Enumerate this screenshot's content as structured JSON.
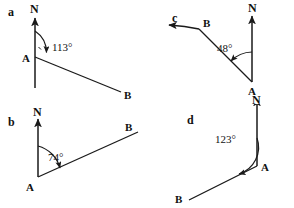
{
  "figure": {
    "type": "bearing-diagrams",
    "panel_count": 4,
    "stroke_color": "#1a1a1a",
    "background_color": "#ffffff"
  },
  "panels": [
    {
      "key": "a",
      "label": "a",
      "north_label": "N",
      "vertex_label": "A",
      "target_label": "B",
      "angle_label": "113°",
      "angle_value": 113,
      "has_right_angle_tick": true,
      "has_extension_arrow": false
    },
    {
      "key": "b",
      "label": "b",
      "north_label": "N",
      "vertex_label": "A",
      "target_label": "B",
      "angle_label": "74°",
      "angle_value": 74,
      "has_right_angle_tick": false,
      "has_extension_arrow": false
    },
    {
      "key": "c",
      "label": "c",
      "north_label": "N",
      "vertex_label": "A",
      "target_label": "B",
      "angle_label": "48°",
      "angle_value": 48,
      "has_right_angle_tick": false,
      "has_extension_arrow": true
    },
    {
      "key": "d",
      "label": "d",
      "north_label": "N",
      "vertex_label": "A",
      "target_label": "B",
      "angle_label": "123°",
      "angle_value": 123,
      "has_right_angle_tick": false,
      "has_extension_arrow": false
    }
  ]
}
